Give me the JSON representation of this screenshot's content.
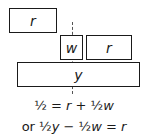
{
  "diagram": {
    "boxes": {
      "top_r": {
        "label": "r"
      },
      "w": {
        "label": "w"
      },
      "mid_r": {
        "label": "r"
      },
      "y": {
        "label": "y"
      }
    },
    "equations": {
      "line1": {
        "lhs": "½",
        "eq": " = ",
        "r": "r",
        "plus": " + ½",
        "w": "w"
      },
      "line2": {
        "prefix": "or ½",
        "y": "y",
        "minus": " − ½",
        "w": "w",
        "eq": " = ",
        "r": "r"
      }
    },
    "colors": {
      "stroke": "#1a1a1a",
      "dash": "#555555",
      "background": "#ffffff"
    }
  }
}
